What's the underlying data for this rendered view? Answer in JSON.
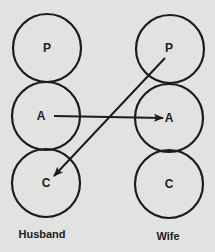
{
  "diagram": {
    "type": "transactional-analysis",
    "colors": {
      "background": "#e2e2e0",
      "ink": "#1c1c1c"
    },
    "people": [
      {
        "name": "Husband",
        "states": [
          {
            "label": "P",
            "cx": 47,
            "cy": 48,
            "r": 34
          },
          {
            "label": "A",
            "cx": 46,
            "cy": 116,
            "r": 34
          },
          {
            "label": "C",
            "cx": 46,
            "cy": 183,
            "r": 34
          }
        ],
        "label_pos": {
          "x": 42,
          "y": 238
        }
      },
      {
        "name": "Wife",
        "states": [
          {
            "label": "P",
            "cx": 170,
            "cy": 49,
            "r": 34
          },
          {
            "label": "A",
            "cx": 169,
            "cy": 118,
            "r": 34
          },
          {
            "label": "C",
            "cx": 169,
            "cy": 184,
            "r": 34
          }
        ],
        "label_pos": {
          "x": 168,
          "y": 240
        }
      }
    ],
    "transactions": [
      {
        "from": "Husband A",
        "to": "Wife A",
        "x1": 54,
        "y1": 116,
        "x2": 163,
        "y2": 118
      },
      {
        "from": "Wife P",
        "to": "Husband C",
        "x1": 165,
        "y1": 58,
        "x2": 54,
        "y2": 176
      }
    ]
  }
}
